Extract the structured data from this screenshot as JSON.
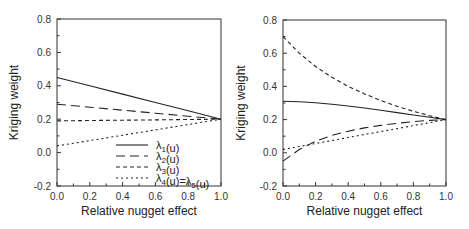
{
  "chart_data": [
    {
      "type": "line",
      "title": "",
      "xlabel": "Relative nugget effect",
      "ylabel": "Kriging weight",
      "xlim": [
        0.0,
        1.0
      ],
      "ylim": [
        -0.2,
        0.8
      ],
      "xticks": [
        "0.0",
        "0.2",
        "0.4",
        "0.6",
        "0.8",
        "1.0"
      ],
      "yticks": [
        "-0.2",
        "0.0",
        "0.2",
        "0.4",
        "0.6",
        "0.8"
      ],
      "grid": false,
      "legend_position": "lower right",
      "x": [
        0.0,
        0.2,
        0.4,
        0.6,
        0.8,
        1.0
      ],
      "series": [
        {
          "name": "λ1(u)",
          "style": "solid",
          "values": [
            0.45,
            0.4,
            0.35,
            0.3,
            0.25,
            0.2
          ]
        },
        {
          "name": "λ2(u)",
          "style": "long-dash",
          "values": [
            0.29,
            0.272,
            0.254,
            0.236,
            0.218,
            0.2
          ]
        },
        {
          "name": "λ3(u)",
          "style": "dash",
          "values": [
            0.19,
            0.192,
            0.194,
            0.196,
            0.198,
            0.2
          ]
        },
        {
          "name": "λ4(u)=λ5(u)",
          "style": "dot",
          "values": [
            0.04,
            0.072,
            0.104,
            0.136,
            0.168,
            0.2
          ]
        }
      ]
    },
    {
      "type": "line",
      "title": "",
      "xlabel": "Relative nugget effect",
      "ylabel": "Kriging weight",
      "xlim": [
        0.0,
        1.0
      ],
      "ylim": [
        -0.2,
        0.8
      ],
      "xticks": [
        "0.0",
        "0.2",
        "0.4",
        "0.6",
        "0.8",
        "1.0"
      ],
      "yticks": [
        "-0.2",
        "0.0",
        "0.2",
        "0.4",
        "0.6",
        "0.8"
      ],
      "grid": false,
      "x": [
        0.0,
        0.1,
        0.2,
        0.3,
        0.4,
        0.5,
        0.6,
        0.7,
        0.8,
        0.9,
        1.0
      ],
      "series": [
        {
          "name": "λ1(u)",
          "style": "solid",
          "values": [
            0.31,
            0.308,
            0.302,
            0.293,
            0.282,
            0.27,
            0.256,
            0.242,
            0.228,
            0.214,
            0.2
          ]
        },
        {
          "name": "λ2(u)",
          "style": "long-dash",
          "values": [
            -0.05,
            0.02,
            0.07,
            0.105,
            0.13,
            0.15,
            0.165,
            0.178,
            0.188,
            0.195,
            0.2
          ]
        },
        {
          "name": "λ3(u)",
          "style": "dash",
          "values": [
            0.7,
            0.6,
            0.52,
            0.455,
            0.4,
            0.355,
            0.315,
            0.28,
            0.25,
            0.223,
            0.2
          ]
        },
        {
          "name": "λ4(u)=λ5(u)",
          "style": "dot",
          "values": [
            0.02,
            0.038,
            0.056,
            0.074,
            0.092,
            0.11,
            0.128,
            0.146,
            0.164,
            0.182,
            0.2
          ]
        }
      ]
    }
  ],
  "legend": {
    "entries": [
      {
        "label": "λ1(u)"
      },
      {
        "label": "λ2(u)"
      },
      {
        "label": "λ3(u)"
      },
      {
        "label": "λ4(u)=λ5(u)"
      }
    ]
  }
}
